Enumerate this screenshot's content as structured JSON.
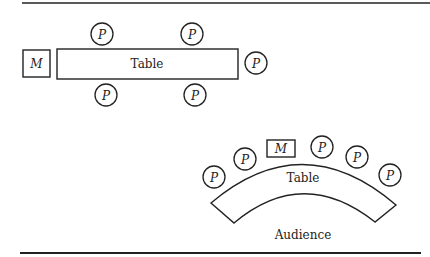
{
  "diagram": {
    "top": {
      "moderator": "M",
      "table": "Table",
      "participant": "P",
      "participants_count": 5
    },
    "bottom": {
      "moderator": "M",
      "table": "Table",
      "participant": "P",
      "participants_count": 5,
      "audience": "Audience"
    }
  }
}
